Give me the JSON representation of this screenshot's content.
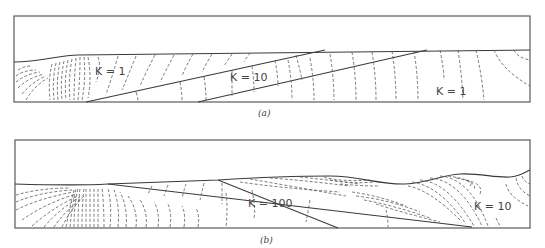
{
  "figure": {
    "panels": [
      {
        "id": "a",
        "caption": "(a)",
        "labels": [
          {
            "text": "K = 1",
            "x": 95,
            "y": 75
          },
          {
            "text": "K = 10",
            "x": 230,
            "y": 81
          },
          {
            "text": "K = 1",
            "x": 436,
            "y": 95
          }
        ]
      },
      {
        "id": "b",
        "caption": "(b)",
        "labels": [
          {
            "text": "K = 100",
            "x": 248,
            "y": 207
          },
          {
            "text": "K = 10",
            "x": 474,
            "y": 210
          }
        ]
      }
    ]
  }
}
